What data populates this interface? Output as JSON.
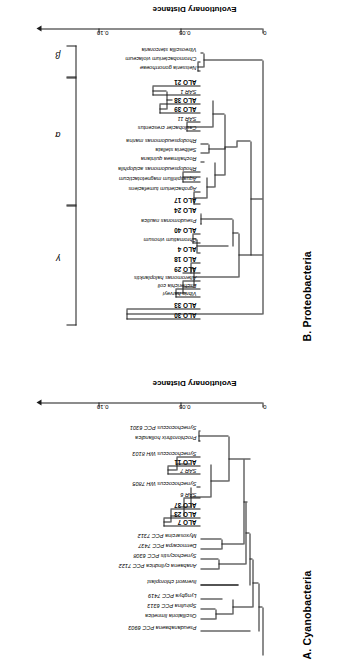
{
  "figure": {
    "orientation": "rotated-90",
    "panels": [
      {
        "id": "A",
        "title": "A. Cyanobacteria",
        "axis": {
          "label": "Evolutionary Distance",
          "ticks": [
            "0",
            "0.05",
            "0.10"
          ],
          "max": 0.135
        },
        "taxa": [
          {
            "name": "Pseudanabaena PCC 6903",
            "bold": false
          },
          {
            "name": "Oscillatoria limnetica",
            "bold": false
          },
          {
            "name": "Spirulina PCC 6313",
            "bold": false
          },
          {
            "name": "Lyngbya PCC 7419",
            "bold": false
          },
          {
            "name": "liverwort chloroplast",
            "bold": false
          },
          {
            "name": "Anabaena cylindrica PCC 7122",
            "bold": false
          },
          {
            "name": "Synechocystis PCC 6308",
            "bold": false
          },
          {
            "name": "Dermocarpa PCC 7437",
            "bold": false
          },
          {
            "name": "Myxosarcina PCC 7312",
            "bold": false
          },
          {
            "name": "ALO 7",
            "bold": true
          },
          {
            "name": "ALO 23",
            "bold": true
          },
          {
            "name": "ALO 37",
            "bold": true
          },
          {
            "name": "SAR 6",
            "bold": false
          },
          {
            "name": "Synechococcus WH 7805",
            "bold": false
          },
          {
            "name": "SAR 7",
            "bold": false
          },
          {
            "name": "ALO 11",
            "bold": true
          },
          {
            "name": "Synechococcus WH 8103",
            "bold": false
          },
          {
            "name": "Prochlorothrix hollandica",
            "bold": false
          },
          {
            "name": "Synechococcus PCC 6301",
            "bold": false
          }
        ]
      },
      {
        "id": "B",
        "title": "B. Proteobacteria",
        "axis": {
          "label": "Evolutionary Distance",
          "ticks": [
            "0",
            "0.05",
            "0.10"
          ],
          "max": 0.135
        },
        "groups": [
          {
            "symbol": "γ",
            "name": "gamma"
          },
          {
            "symbol": "α",
            "name": "alpha"
          },
          {
            "symbol": "β",
            "name": "beta"
          }
        ],
        "taxa": [
          {
            "name": "ALO 30",
            "bold": true
          },
          {
            "name": "ALO 33",
            "bold": true
          },
          {
            "name": "Vibrio harveyi",
            "bold": false
          },
          {
            "name": "Escherichia coli",
            "bold": false
          },
          {
            "name": "Alteromonas haloplanktis",
            "bold": false
          },
          {
            "name": "ALO 29",
            "bold": true
          },
          {
            "name": "ALO 18",
            "bold": true
          },
          {
            "name": "ALO 4",
            "bold": true
          },
          {
            "name": "Chromatium vinosum",
            "bold": false
          },
          {
            "name": "ALO 40",
            "bold": true
          },
          {
            "name": "Pseudomonas nautica",
            "bold": false
          },
          {
            "name": "ALO 24",
            "bold": true
          },
          {
            "name": "ALO 17",
            "bold": true
          },
          {
            "name": "Agrobacterium tumefaciens",
            "bold": false
          },
          {
            "name": "Aquaspirillum magnetotacticum",
            "bold": false
          },
          {
            "name": "Rhodopseudomonas acidophila",
            "bold": false
          },
          {
            "name": "Rochalimaea quintana",
            "bold": false
          },
          {
            "name": "Seliberia stellata",
            "bold": false
          },
          {
            "name": "Rhodopseudomonas marina",
            "bold": false
          },
          {
            "name": "Caulobacter crescentus",
            "bold": false
          },
          {
            "name": "SAR 11",
            "bold": false
          },
          {
            "name": "ALO 39",
            "bold": true
          },
          {
            "name": "ALO 38",
            "bold": true
          },
          {
            "name": "SAR 1",
            "bold": false
          },
          {
            "name": "ALO 21",
            "bold": true
          },
          {
            "name": "Neisseria gonorrhoeae",
            "bold": false
          },
          {
            "name": "Chromobacterium violaceum",
            "bold": false
          },
          {
            "name": "Vitreoscilla stercoraria",
            "bold": false
          }
        ]
      }
    ]
  },
  "chart_data": {
    "type": "tree",
    "xlabel": "Evolutionary Distance",
    "xticks": [
      0,
      0.05,
      0.1
    ],
    "panels": {
      "A": {
        "label": "A. Cyanobacteria",
        "tips": [
          {
            "taxon": "Pseudanabaena PCC 6903",
            "branch_x": 0.013
          },
          {
            "taxon": "Oscillatoria limnetica",
            "branch_x": 0.047
          },
          {
            "taxon": "Spirulina PCC 6313",
            "branch_x": 0.047
          },
          {
            "taxon": "Lyngbya PCC 7419",
            "branch_x": 0.037
          },
          {
            "taxon": "liverwort chloroplast",
            "branch_x": 0.021
          },
          {
            "taxon": "Anabaena cylindrica PCC 7122",
            "branch_x": 0.044
          },
          {
            "taxon": "Synechocystis PCC 6308",
            "branch_x": 0.044
          },
          {
            "taxon": "Dermocarpa PCC 7437",
            "branch_x": 0.041
          },
          {
            "taxon": "Myxosarcina PCC 7312",
            "branch_x": 0.041
          },
          {
            "taxon": "ALO 7",
            "branch_x": 0.092
          },
          {
            "taxon": "ALO 23",
            "branch_x": 0.092
          },
          {
            "taxon": "ALO 37",
            "branch_x": 0.086
          },
          {
            "taxon": "SAR 6",
            "branch_x": 0.076
          },
          {
            "taxon": "Synechococcus WH 7805",
            "branch_x": 0.064
          },
          {
            "taxon": "SAR 7",
            "branch_x": 0.089
          },
          {
            "taxon": "ALO 11",
            "branch_x": 0.089
          },
          {
            "taxon": "Synechococcus WH 8103",
            "branch_x": 0.082
          },
          {
            "taxon": "Prochlorothrix hollandica",
            "branch_x": 0.058
          },
          {
            "taxon": "Synechococcus PCC 6301",
            "branch_x": 0.058
          }
        ]
      },
      "B": {
        "label": "B. Proteobacteria",
        "groups": [
          "γ",
          "α",
          "β"
        ],
        "tips": [
          {
            "taxon": "ALO 30",
            "branch_x": 0.106,
            "group": "γ"
          },
          {
            "taxon": "ALO 33",
            "branch_x": 0.106,
            "group": "γ"
          },
          {
            "taxon": "Vibrio harveyi",
            "branch_x": 0.075,
            "group": "γ"
          },
          {
            "taxon": "Escherichia coli",
            "branch_x": 0.075,
            "group": "γ"
          },
          {
            "taxon": "Alteromonas haloplanktis",
            "branch_x": 0.065,
            "group": "γ"
          },
          {
            "taxon": "ALO 29",
            "branch_x": 0.065,
            "group": "γ"
          },
          {
            "taxon": "ALO 18",
            "branch_x": 0.057,
            "group": "γ"
          },
          {
            "taxon": "ALO 4",
            "branch_x": 0.05,
            "group": "γ"
          },
          {
            "taxon": "Chromatium vinosum",
            "branch_x": 0.055,
            "group": "γ"
          },
          {
            "taxon": "ALO 40",
            "branch_x": 0.055,
            "group": "γ"
          },
          {
            "taxon": "Pseudomonas nautica",
            "branch_x": 0.045,
            "group": "γ"
          },
          {
            "taxon": "ALO 24",
            "branch_x": 0.045,
            "group": "γ"
          },
          {
            "taxon": "ALO 17",
            "branch_x": 0.053,
            "group": "α"
          },
          {
            "taxon": "Agrobacterium tumefaciens",
            "branch_x": 0.053,
            "group": "α"
          },
          {
            "taxon": "Aquaspirillum magnetotacticum",
            "branch_x": 0.065,
            "group": "α"
          },
          {
            "taxon": "Rhodopseudomonas acidophila",
            "branch_x": 0.065,
            "group": "α"
          },
          {
            "taxon": "Rochalimaea quintana",
            "branch_x": 0.043,
            "group": "α"
          },
          {
            "taxon": "Seliberia stellata",
            "branch_x": 0.04,
            "group": "α"
          },
          {
            "taxon": "Rhodopseudomonas marina",
            "branch_x": 0.04,
            "group": "α"
          },
          {
            "taxon": "Caulobacter crescentus",
            "branch_x": 0.062,
            "group": "α"
          },
          {
            "taxon": "SAR 11",
            "branch_x": 0.062,
            "group": "α"
          },
          {
            "taxon": "ALO 39",
            "branch_x": 0.088,
            "group": "α"
          },
          {
            "taxon": "ALO 38",
            "branch_x": 0.088,
            "group": "α"
          },
          {
            "taxon": "SAR 1",
            "branch_x": 0.095,
            "group": "α"
          },
          {
            "taxon": "ALO 21",
            "branch_x": 0.095,
            "group": "α"
          },
          {
            "taxon": "Neisseria gonorrhoeae",
            "branch_x": 0.05,
            "group": "β"
          },
          {
            "taxon": "Chromobacterium violaceum",
            "branch_x": 0.05,
            "group": "β"
          },
          {
            "taxon": "Vitreoscilla stercoraria",
            "branch_x": 0.044,
            "group": "β"
          }
        ]
      }
    }
  }
}
